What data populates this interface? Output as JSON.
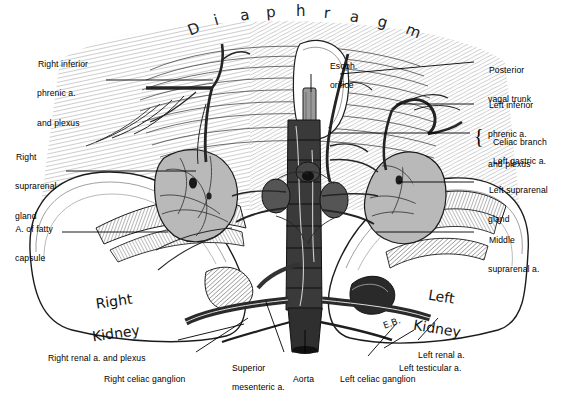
{
  "plate": {
    "title": "Diaphragm",
    "title_letters": [
      "D",
      "i",
      "a",
      "p",
      "h",
      "r",
      "a",
      "g",
      "m"
    ],
    "signature": "E.B.",
    "background": "#ffffff",
    "ink": "#1a1a1a",
    "gland_fill": "#b9b9b9",
    "vessel_dark": "#2b2b2b",
    "aorta_fill": "#3a3a3a"
  },
  "organ_labels": [
    {
      "name": "right-kidney",
      "text_line1": "Right",
      "text_line2": "Kidney"
    },
    {
      "name": "left-kidney",
      "text_line1": "Left",
      "text_line2": "Kidney"
    }
  ],
  "labels_left": [
    {
      "name": "right-inferior-phrenic",
      "lines": [
        "Right inferior",
        "phrenic a.",
        "and plexus"
      ]
    },
    {
      "name": "right-suprarenal-gland",
      "lines": [
        "Right",
        "suprarenal",
        "gland"
      ]
    },
    {
      "name": "artery-of-fatty-capsule",
      "lines": [
        "A. of fatty",
        "capsule"
      ]
    }
  ],
  "labels_right": [
    {
      "name": "posterior-vagal-trunk",
      "lines": [
        "Posterior",
        "vagal trunk"
      ]
    },
    {
      "name": "left-inferior-phrenic",
      "lines": [
        "Left inferior",
        "phrenic a.",
        "and plexus"
      ]
    },
    {
      "name": "celiac-branch-left-gastric",
      "braced": true,
      "lines": [
        "Celiac branch",
        "Left gastric a."
      ]
    },
    {
      "name": "left-suprarenal-gland",
      "lines": [
        "Left suprarenal",
        "gland"
      ]
    },
    {
      "name": "middle-suprarenal-artery",
      "lines": [
        "Middle",
        "suprarenal a."
      ]
    }
  ],
  "labels_inset": [
    {
      "name": "esophageal-orifice",
      "lines": [
        "Esoph.",
        "orifice"
      ]
    }
  ],
  "labels_bottom": [
    {
      "name": "right-renal-artery-and-plexus",
      "lines": [
        "Right renal a. and plexus"
      ]
    },
    {
      "name": "right-celiac-ganglion",
      "lines": [
        "Right celiac ganglion"
      ]
    },
    {
      "name": "superior-mesenteric-artery",
      "lines": [
        "Superior",
        "mesenteric a."
      ]
    },
    {
      "name": "aorta",
      "lines": [
        "Aorta"
      ]
    },
    {
      "name": "left-celiac-ganglion",
      "lines": [
        "Left celiac ganglion"
      ]
    },
    {
      "name": "left-testicular-artery",
      "lines": [
        "Left testicular a."
      ]
    },
    {
      "name": "left-renal-artery",
      "lines": [
        "Left renal a."
      ]
    }
  ]
}
